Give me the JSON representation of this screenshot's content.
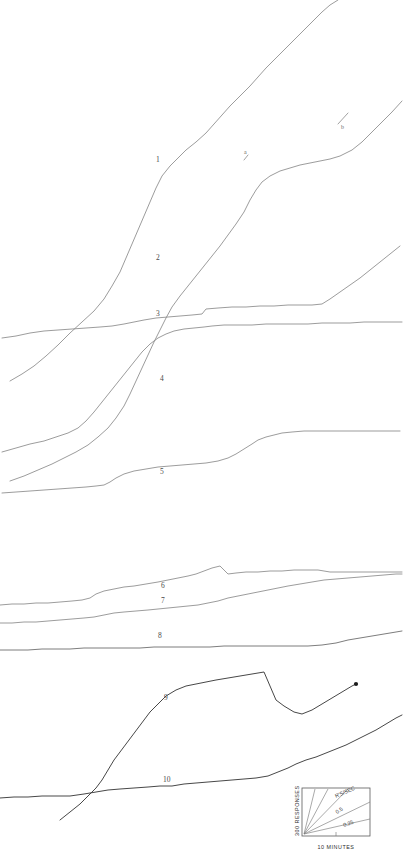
{
  "figure": {
    "background": "#ffffff",
    "line_color": "#8a8a8a",
    "dark_line_color": "#3d3d3d",
    "width": 403,
    "height": 859
  },
  "curve_labels": [
    {
      "id": "1",
      "text": "1",
      "x": 156,
      "y": 162
    },
    {
      "id": "2",
      "text": "2",
      "x": 156,
      "y": 260
    },
    {
      "id": "3",
      "text": "3",
      "x": 156,
      "y": 316
    },
    {
      "id": "4",
      "text": "4",
      "x": 160,
      "y": 381
    },
    {
      "id": "5",
      "text": "5",
      "x": 160,
      "y": 474
    },
    {
      "id": "6",
      "text": "6",
      "x": 161,
      "y": 588
    },
    {
      "id": "7",
      "text": "7",
      "x": 161,
      "y": 603
    },
    {
      "id": "8",
      "text": "8",
      "x": 158,
      "y": 638
    },
    {
      "id": "9",
      "text": "9",
      "x": 164,
      "y": 700
    },
    {
      "id": "10",
      "text": "10",
      "x": 163,
      "y": 782
    }
  ],
  "segment_marks": [
    {
      "id": "a",
      "text": "a",
      "x": 244,
      "y": 154
    },
    {
      "id": "b",
      "text": "b",
      "x": 341,
      "y": 129
    }
  ],
  "legend": {
    "y_axis_label": "300 RESPONSES",
    "x_axis_label": "10 MINUTES",
    "rate_unit_label": "R'S/SEC",
    "rates": [
      {
        "value": "0.5",
        "x": 337,
        "y": 814,
        "rotate": -33
      },
      {
        "value": "0.25",
        "x": 344,
        "y": 827,
        "rotate": -20
      }
    ],
    "unlabeled_rays": 2,
    "box": {
      "x": 302,
      "y": 788,
      "width": 68,
      "height": 48
    }
  },
  "chart_data": {
    "type": "line",
    "xlabel": "10 MINUTES",
    "ylabel": "300 RESPONSES",
    "legend_position": "bottom-right",
    "grid": false,
    "rate_calibration_lines": [
      "0.5",
      "0.25"
    ],
    "rate_units": "R'S/SEC",
    "series": [
      {
        "name": "1",
        "label_x": 156,
        "label_y": 162,
        "points": "10,381 22,374 34,366 46,356 58,345 70,333 82,322 94,311 104,299 112,286 120,272 126,258 132,244 138,230 144,216 150,202 156,188 162,176 170,166 178,158 186,150 196,142 206,133 214,124 222,115 230,106 240,96 250,86 258,77 266,68 274,60 282,52 290,44 298,36 306,28 314,20 322,12 330,5 338,0"
      },
      {
        "name": "2",
        "label_x": 156,
        "label_y": 260,
        "points": "10,481 24,476 38,470 52,464 64,458 76,452 88,445 98,437 108,428 116,418 124,406 130,394 136,381 142,368 148,355 154,342 160,330 166,318 172,307 180,296 188,286 196,276 204,266 212,256 220,246 228,235 236,224 244,212 250,200 256,190 262,182 270,176 280,171 290,168 300,165 310,163 320,161 330,159 340,156 352,150 362,142 372,132 382,122 392,112 402,101"
      },
      {
        "name": "3",
        "label_x": 156,
        "label_y": 316,
        "points": "2,338 16,336 30,333 44,331 58,330 72,329 86,328 100,327 112,326 124,324 134,322 144,320 156,318 168,317 180,316 192,315 202,314 206,309 218,308 232,307 246,307 260,306 274,306 288,305 300,305 312,305 322,304 330,299 340,292 350,285 360,278 370,270 380,262 390,254 400,246"
      },
      {
        "name": "4",
        "label_x": 160,
        "label_y": 381,
        "points": "2,452 16,448 30,444 44,441 56,437 68,433 78,428 86,421 94,412 102,402 110,392 118,382 126,372 134,362 142,352 150,344 158,338 166,334 174,331 184,329 194,328 204,327 212,326 224,325 238,325 252,325 266,324 280,324 294,324 308,324 322,323 336,323 350,323 364,322 378,322 392,322 402,322"
      },
      {
        "name": "5",
        "label_x": 160,
        "label_y": 474,
        "points": "2,493 16,492 30,491 44,490 58,489 72,488 86,487 96,486 104,485 110,482 116,478 124,474 134,471 146,469 158,467 170,466 182,465 194,464 206,463 218,461 228,458 236,454 244,449 252,444 258,440 266,437 274,435 282,433 292,432 304,431 316,431 328,431 340,431 352,431 364,431 376,431 388,431 400,431"
      },
      {
        "name": "6",
        "label_x": 161,
        "label_y": 588,
        "points": "0,605 12,604 24,604 36,603 48,603 60,602 72,601 82,600 90,598 96,594 104,591 114,589 124,587 134,586 146,584 158,582 168,580 178,578 188,576 196,574 204,571 212,568 220,566 228,574 236,573 246,572 258,572 270,571 282,571 294,570 306,570 318,570 330,572 342,572 354,572 366,572 378,572 390,572 402,572"
      },
      {
        "name": "7",
        "label_x": 161,
        "label_y": 603,
        "points": "0,623 12,623 24,622 36,622 48,621 60,620 72,619 84,618 94,617 104,615 114,613 124,612 136,611 148,610 158,609 168,608 178,607 188,606 198,605 208,603 218,601 228,598 238,596 248,594 258,592 268,590 278,588 288,586 300,584 312,582 324,580 336,579 348,578 360,577 372,576 384,575 396,574 402,574"
      },
      {
        "name": "8",
        "label_x": 158,
        "label_y": 638,
        "points": "0,650 14,650 28,650 42,649 56,649 70,649 84,648 98,648 112,648 126,648 140,648 154,647 168,647 182,647 196,647 210,647 224,646 238,646 252,646 266,646 280,646 294,646 308,646 322,645 336,643 348,640 360,638 372,636 384,634 396,632 402,631"
      },
      {
        "name": "9",
        "label_x": 164,
        "label_y": 700,
        "points": "60,820 70,812 80,804 88,796 96,788 102,780 108,770 114,760 120,752 126,744 132,736 138,728 144,720 150,712 158,704 166,696 176,690 186,686 196,684 206,682 216,680 228,678 240,676 252,674 264,672 276,700 284,706 294,712 302,714 312,710 322,704 332,698 342,692 352,686 356,684"
      },
      {
        "name": "10",
        "label_x": 163,
        "label_y": 782,
        "points": "0,798 14,797 28,797 42,796 56,796 70,796 84,794 96,792 108,790 120,789 134,788 148,787 160,786 172,786 184,784 196,783 208,782 220,781 232,780 244,779 256,778 268,776 278,772 288,768 296,764 306,760 316,757 326,753 336,749 346,745 356,740 366,735 376,730 386,724 396,718 402,715"
      }
    ]
  }
}
